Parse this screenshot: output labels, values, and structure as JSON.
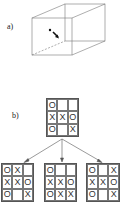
{
  "labels": {
    "a": "a)",
    "b": "b)"
  },
  "cube": {
    "stroke": "#777777",
    "dot_color": "#111111"
  },
  "root_board": [
    [
      "O",
      "",
      ""
    ],
    [
      "X",
      "X",
      "O"
    ],
    [
      "O",
      "",
      "X"
    ]
  ],
  "child_boards": [
    [
      [
        "O",
        "X",
        ""
      ],
      [
        "X",
        "X",
        "O"
      ],
      [
        "O",
        "",
        "X"
      ]
    ],
    [
      [
        "O",
        "",
        ""
      ],
      [
        "X",
        "X",
        "O"
      ],
      [
        "O",
        "X",
        "X"
      ]
    ],
    [
      [
        "O",
        "",
        "X"
      ],
      [
        "X",
        "X",
        "O"
      ],
      [
        "O",
        "",
        "X"
      ]
    ]
  ]
}
